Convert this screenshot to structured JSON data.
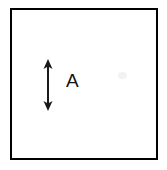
{
  "figure": {
    "type": "technical-line-drawing",
    "background_color": "#ffffff",
    "canvas": {
      "width": 167,
      "height": 170
    }
  },
  "frame": {
    "name": "outer-square-outline",
    "stroke_color": "#000000",
    "stroke_width": 2,
    "fill_color": "#ffffff",
    "x": 10,
    "y": 8,
    "width": 148,
    "height": 152
  },
  "annotations": {
    "dimension_arrow": {
      "name": "vertical-double-headed-arrow",
      "orientation": "vertical",
      "heads": "both",
      "stroke_color": "#1a1a1a",
      "stroke_width": 2,
      "x_center": 48,
      "y_top": 60,
      "y_bottom": 110,
      "length": 50,
      "head_width": 9,
      "head_height": 9
    },
    "label": {
      "name": "dimension-label-a",
      "text": "A",
      "color": "#141414",
      "font_size": 19,
      "x": 66,
      "y": 71
    }
  },
  "artifacts": {
    "scan_smudge": {
      "name": "faint-scan-smudge",
      "color": "#f2f2f2",
      "x": 118,
      "y": 72
    }
  }
}
